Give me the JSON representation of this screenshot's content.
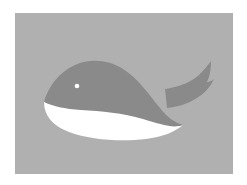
{
  "artwork": {
    "title": "Whale",
    "subject": "whale",
    "style": "flat vector illustration",
    "alt_text": "Flat illustration of a grey whale with a white belly and an upswept tail fin on a grey background",
    "canvas": {
      "width": 247,
      "height": 185,
      "page_background": "#ffffff"
    },
    "panel": {
      "x": 15,
      "y": 13,
      "width": 218,
      "height": 161,
      "background_color": "#b0b0b0"
    },
    "palette": {
      "page": "#ffffff",
      "background": "#b0b0b0",
      "body": "#8a8a8a",
      "belly": "#ffffff",
      "eye": "#ffffff"
    },
    "parts": [
      {
        "name": "body",
        "label": "Whale body",
        "color": "#8a8a8a"
      },
      {
        "name": "tail",
        "label": "Tail fluke",
        "color": "#8a8a8a"
      },
      {
        "name": "belly",
        "label": "White belly",
        "color": "#ffffff"
      },
      {
        "name": "eye",
        "label": "Eye",
        "color": "#ffffff",
        "center_x": 77,
        "center_y": 86,
        "radius": 2.2
      }
    ]
  }
}
